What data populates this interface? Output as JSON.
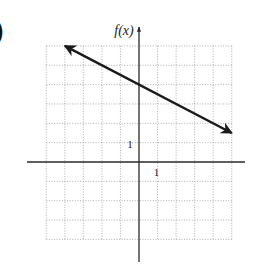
{
  "problem_label": ")",
  "chart_data": {
    "type": "line",
    "title": "",
    "xlabel": "",
    "ylabel": "f(x)",
    "xlim": [
      -5,
      5
    ],
    "ylim": [
      -4,
      6
    ],
    "grid": true,
    "grid_style": "dotted",
    "tick_labels": {
      "x_unit": "1",
      "y_unit": "1"
    },
    "series": [
      {
        "name": "f(x)",
        "equation": "f(x) = -0.5x + 4",
        "slope": -0.5,
        "y_intercept": 4,
        "x": [
          -4,
          5
        ],
        "y": [
          6,
          1.5
        ],
        "arrows": "both"
      }
    ]
  },
  "colors": {
    "grid": "#9a9a9a",
    "axis": "#2a2a2a",
    "line": "#1a1a1a",
    "text": "#222222"
  }
}
